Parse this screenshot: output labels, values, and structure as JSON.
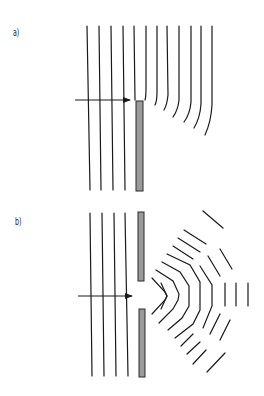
{
  "panels": [
    {
      "label": "a)",
      "description": "Plane waves diffracting around the edge of a single barrier"
    },
    {
      "label": "b)",
      "description": "Plane waves diffracting through a narrow slit, producing circular wavefronts"
    }
  ],
  "colors": {
    "wave": "#1a1a1a",
    "barrier_fill": "#9a9a9a",
    "barrier_stroke": "#2a2a2a",
    "background": "#ffffff"
  }
}
